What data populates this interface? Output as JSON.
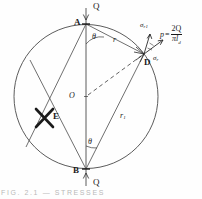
{
  "figure": {
    "geometry": {
      "circle": {
        "cx": 86,
        "cy": 96.5,
        "r": 72
      },
      "points": {
        "A": {
          "x": 86,
          "y": 24
        },
        "B": {
          "x": 86,
          "y": 169
        },
        "D": {
          "x": 144,
          "y": 54
        },
        "O": {
          "x": 86,
          "y": 96.5
        },
        "E": {
          "x": 44,
          "y": 118
        }
      }
    },
    "labels": {
      "point_a": "A",
      "point_b": "B",
      "point_d": "D",
      "point_o": "O",
      "point_e": "E",
      "load_top": "Q",
      "load_bottom": "Q",
      "radius_r": "r",
      "radius_r1": "r",
      "radius_r1_sub": "1",
      "angle_top": "θ",
      "angle_bottom": "θ",
      "sigma_r1": "σ",
      "sigma_r1_sub": "r1",
      "sigma_r": "σ",
      "sigma_r_sub": "r"
    },
    "formula": {
      "lhs": "p",
      "equals": "=",
      "numerator": "2Q",
      "denominator_pi": "π",
      "denominator_l": "l",
      "denominator_d": "d"
    },
    "caption": "FIG.  2.1  —  STRESSES",
    "colors": {
      "ink": "#1a1a1a",
      "line": "#4a4a4a",
      "paper": "#fefefe",
      "caption": "#b9b9b9"
    }
  }
}
